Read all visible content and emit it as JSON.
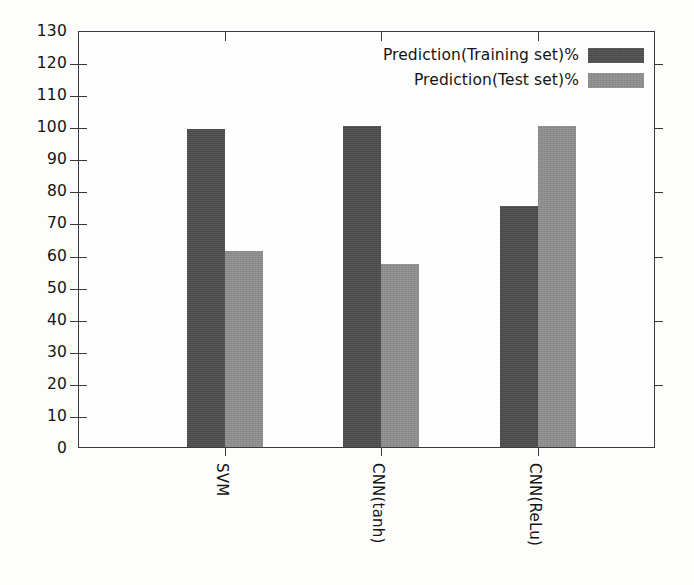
{
  "chart_data": {
    "type": "bar",
    "title": "",
    "xlabel": "",
    "ylabel": "",
    "categories": [
      "SVM",
      "CNN(tanh)",
      "CNN(ReLu)"
    ],
    "series": [
      {
        "name": "Prediction(Training set)%",
        "color": "#4b4b4b",
        "values": [
          99,
          100,
          75
        ]
      },
      {
        "name": "Prediction(Test set)%",
        "color": "#8c8c8c",
        "values": [
          61,
          57,
          100
        ]
      }
    ],
    "ylim": [
      0,
      130
    ],
    "ytick_step": 10,
    "yticks": [
      "0",
      "10",
      "20",
      "30",
      "40",
      "50",
      "60",
      "70",
      "80",
      "90",
      "100",
      "110",
      "120",
      "130"
    ],
    "grid": false,
    "legend_position": "top-right",
    "xtick_label_rotation": 90
  },
  "legend": {
    "entries": [
      {
        "label": "Prediction(Training set)%",
        "swatch": "train"
      },
      {
        "label": "Prediction(Test set)%",
        "swatch": "test"
      }
    ]
  },
  "axes": {
    "y_tick_labels": [
      "130",
      "120",
      "110",
      "100",
      "90",
      "80",
      "70",
      "60",
      "50",
      "40",
      "30",
      "20",
      "10",
      "0"
    ],
    "x_tick_labels": [
      "SVM",
      "CNN(tanh)",
      "CNN(ReLu)"
    ]
  },
  "colors": {
    "training_bar": "#4b4b4b",
    "test_bar": "#8c8c8c",
    "axis": "#3a3a3a",
    "background": "#fdfdfc"
  }
}
